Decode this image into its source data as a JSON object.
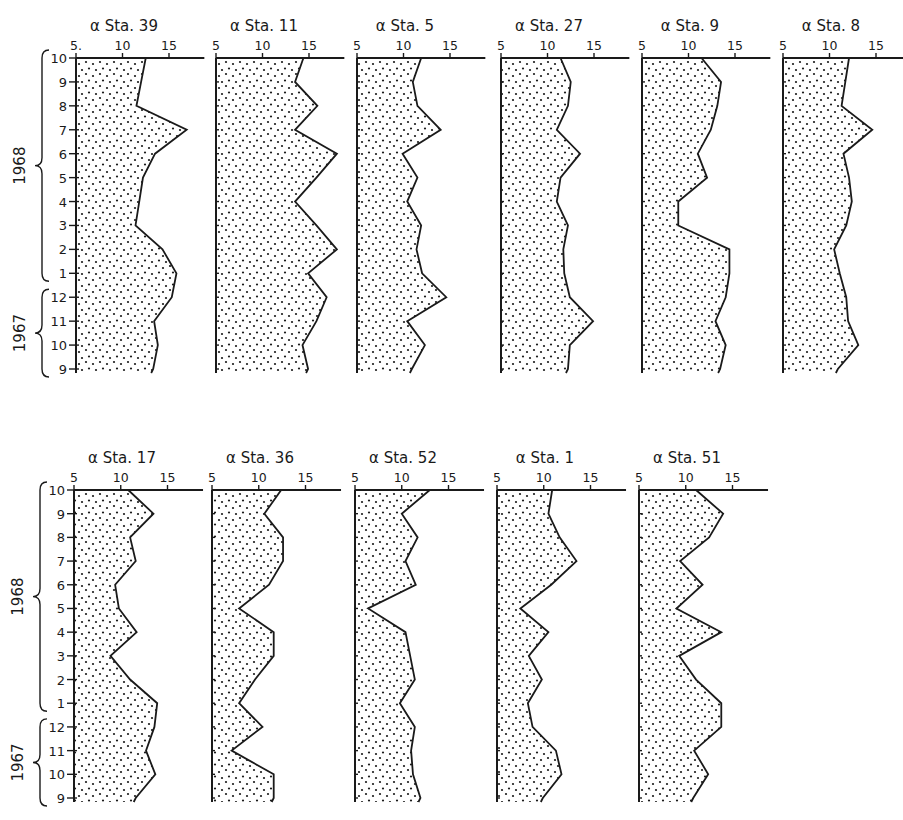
{
  "chart_data": {
    "type": "area",
    "x_axis": {
      "label_prefix": "α",
      "ticks": [
        5,
        10,
        15
      ],
      "range": [
        5,
        18.8
      ]
    },
    "y_axis": {
      "months": [
        "10",
        "9",
        "8",
        "7",
        "6",
        "5",
        "4",
        "3",
        "2",
        "1",
        "12",
        "11",
        "10",
        "9"
      ],
      "year_groups": [
        {
          "label": "1968",
          "from_index": 0,
          "to_index": 9
        },
        {
          "label": "1967",
          "from_index": 10,
          "to_index": 13
        }
      ]
    },
    "rows": [
      {
        "panels": [
          {
            "title": "α  Sta. 39",
            "station": "39",
            "tick_labels": [
              "5.",
              "10",
              "15"
            ],
            "values": [
              12.5,
              12.0,
              11.5,
              16.9,
              13.5,
              12.2,
              11.8,
              11.4,
              14.3,
              15.8,
              15.3,
              13.4,
              13.8,
              13.3
            ]
          },
          {
            "title": "α  Sta. 11",
            "station": "11",
            "tick_labels": [
              "5",
              "10",
              "15"
            ],
            "values": [
              14.4,
              13.5,
              15.9,
              13.5,
              18.0,
              15.8,
              13.5,
              15.8,
              18.0,
              14.9,
              16.9,
              15.8,
              14.3,
              14.9
            ]
          },
          {
            "title": "α  Sta. 5",
            "station": "5",
            "tick_labels": [
              "5",
              "10",
              "15"
            ],
            "values": [
              11.9,
              11.0,
              11.5,
              14.0,
              9.9,
              11.5,
              10.4,
              11.9,
              11.4,
              12.0,
              14.6,
              10.4,
              12.3,
              10.9
            ]
          },
          {
            "title": "α  Sta. 27",
            "station": "27",
            "tick_labels": [
              "5",
              "10",
              "15"
            ],
            "values": [
              11.4,
              12.5,
              12.2,
              11.0,
              13.5,
              11.4,
              11.0,
              12.2,
              11.7,
              11.8,
              12.4,
              14.9,
              12.4,
              12.2
            ]
          },
          {
            "title": "α  Sta. 9",
            "station": "9",
            "tick_labels": [
              "5",
              "10",
              "15"
            ],
            "values": [
              11.4,
              13.5,
              13.1,
              12.4,
              11.0,
              12.0,
              8.9,
              8.9,
              14.4,
              14.4,
              14.0,
              12.9,
              14.0,
              13.4
            ]
          },
          {
            "title": "α  Sta. 8",
            "station": "8",
            "tick_labels": [
              "5",
              "10",
              "15"
            ],
            "values": [
              12.1,
              11.7,
              11.3,
              14.6,
              11.5,
              12.1,
              12.4,
              11.8,
              10.5,
              11.1,
              11.8,
              12.0,
              13.1,
              10.9
            ]
          }
        ]
      },
      {
        "panels": [
          {
            "title": "α  Sta. 17",
            "station": "17",
            "tick_labels": [
              "5",
              "10",
              "15"
            ],
            "values": [
              10.8,
              13.5,
              11.0,
              11.6,
              9.4,
              9.8,
              11.7,
              8.9,
              11.0,
              13.9,
              13.6,
              12.7,
              13.7,
              11.6
            ]
          },
          {
            "title": "α  Sta. 36",
            "station": "36",
            "tick_labels": [
              "5",
              "10",
              "15"
            ],
            "values": [
              12.4,
              10.6,
              12.6,
              12.6,
              11.1,
              7.9,
              11.6,
              11.6,
              9.6,
              7.9,
              10.4,
              7.1,
              11.6,
              11.6
            ]
          },
          {
            "title": "α  Sta. 52",
            "station": "52",
            "tick_labels": [
              "5",
              "10",
              "15"
            ],
            "values": [
              13.0,
              10.0,
              11.7,
              10.4,
              11.5,
              6.4,
              10.4,
              10.9,
              11.4,
              9.8,
              11.4,
              11.0,
              11.2,
              12.0
            ]
          },
          {
            "title": "α  Sta. 1",
            "station": "1",
            "tick_labels": [
              "5",
              "10",
              "15"
            ],
            "values": [
              10.9,
              10.5,
              11.7,
              13.5,
              10.8,
              7.5,
              10.5,
              8.4,
              9.8,
              8.3,
              8.8,
              11.3,
              11.9,
              9.9
            ]
          },
          {
            "title": "α  Sta. 51",
            "station": "51",
            "tick_labels": [
              "5",
              "10",
              "15"
            ],
            "values": [
              11.1,
              14.0,
              12.5,
              9.4,
              11.8,
              9.0,
              13.8,
              9.3,
              11.1,
              13.8,
              13.8,
              10.9,
              12.4,
              10.8
            ]
          }
        ]
      }
    ],
    "grid": false,
    "legend": "none"
  },
  "layout": {
    "rows": [
      {
        "axis_y": 58,
        "bottom_y": 369,
        "origins": [
          76,
          216,
          357,
          501,
          642,
          783
        ],
        "px_per_unit": 9.3,
        "month_label_x": 28
      },
      {
        "axis_y": 490,
        "bottom_y": 798,
        "origins": [
          74,
          212,
          355,
          497,
          639
        ],
        "px_per_unit": 9.35,
        "month_label_x": 26
      }
    ],
    "last_axis_extends_to_edge": true,
    "ink_color": "#1a1a1a",
    "paper_color": "#ffffff"
  }
}
